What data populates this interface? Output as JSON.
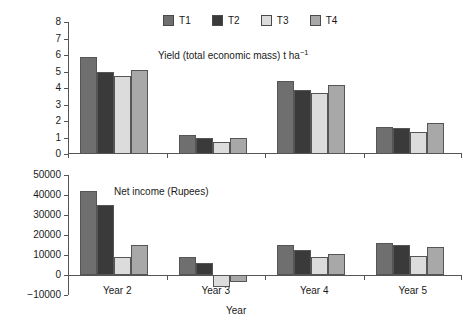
{
  "legend": {
    "position": "top-center",
    "entries": [
      {
        "label": "T1",
        "color": "#6f6f6f"
      },
      {
        "label": "T2",
        "color": "#3a3a3a"
      },
      {
        "label": "T3",
        "color": "#dcdcdc"
      },
      {
        "label": "T4",
        "color": "#a8a8a8"
      }
    ]
  },
  "axis_titles": {
    "x": "Year"
  },
  "panels": {
    "yield": {
      "title_main": "Yield (total economic mass) t ha",
      "title_sup": "−1",
      "y_ticks": [
        "0",
        "1",
        "2",
        "3",
        "4",
        "5",
        "6",
        "7",
        "8"
      ]
    },
    "income": {
      "title": "Net income (Rupees)",
      "y_ticks": [
        "−10000",
        "0",
        "10000",
        "20000",
        "30000",
        "40000",
        "50000"
      ]
    }
  },
  "chart_data": [
    {
      "type": "bar",
      "title": "Yield (total economic mass) t ha−1",
      "xlabel": "Year",
      "ylabel": "",
      "ylim": [
        0,
        8
      ],
      "ytick_step": 1,
      "grid": false,
      "legend_position": "top-center",
      "categories": [
        "Year 2",
        "Year 3",
        "Year 4",
        "Year 5"
      ],
      "series": [
        {
          "name": "T1",
          "color": "#6f6f6f",
          "values": [
            5.85,
            1.15,
            4.4,
            1.65
          ]
        },
        {
          "name": "T2",
          "color": "#3a3a3a",
          "values": [
            5.0,
            1.0,
            3.9,
            1.6
          ]
        },
        {
          "name": "T3",
          "color": "#dcdcdc",
          "values": [
            4.7,
            0.7,
            3.7,
            1.35
          ]
        },
        {
          "name": "T4",
          "color": "#a8a8a8",
          "values": [
            5.1,
            1.0,
            4.2,
            1.85
          ]
        }
      ]
    },
    {
      "type": "bar",
      "title": "Net income (Rupees)",
      "xlabel": "Year",
      "ylabel": "",
      "ylim": [
        -10000,
        50000
      ],
      "ytick_step": 10000,
      "grid": false,
      "legend_position": "top-center",
      "categories": [
        "Year 2",
        "Year 3",
        "Year 4",
        "Year 5"
      ],
      "series": [
        {
          "name": "T1",
          "color": "#6f6f6f",
          "values": [
            42000,
            9000,
            15200,
            16200
          ]
        },
        {
          "name": "T2",
          "color": "#3a3a3a",
          "values": [
            35000,
            6000,
            12700,
            15000
          ]
        },
        {
          "name": "T3",
          "color": "#dcdcdc",
          "values": [
            9000,
            -6000,
            9200,
            9700
          ]
        },
        {
          "name": "T4",
          "color": "#a8a8a8",
          "values": [
            14800,
            -3500,
            10500,
            14100
          ]
        }
      ]
    }
  ]
}
